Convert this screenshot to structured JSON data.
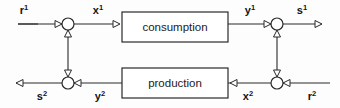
{
  "diagram": {
    "background_color": "#fdfdfd",
    "line_color": "#2a2a2a",
    "blocks": [
      {
        "id": "consumption",
        "label": "consumption",
        "x": 122,
        "y": 12,
        "w": 106,
        "h": 30
      },
      {
        "id": "production",
        "label": "production",
        "x": 122,
        "y": 68,
        "w": 106,
        "h": 30
      }
    ],
    "junctions": [
      {
        "id": "sum-top-left",
        "cx": 68,
        "cy": 24,
        "r": 6
      },
      {
        "id": "sum-top-right",
        "cx": 277,
        "cy": 24,
        "r": 6
      },
      {
        "id": "sum-bottom-left",
        "cx": 68,
        "cy": 83,
        "r": 6
      },
      {
        "id": "sum-bottom-right",
        "cx": 277,
        "cy": 83,
        "r": 6
      }
    ],
    "signals": [
      {
        "id": "r1",
        "base": "r",
        "sup": "1",
        "text": "r¹",
        "x": 24,
        "y": 14
      },
      {
        "id": "x1",
        "base": "x",
        "sup": "1",
        "text": "x¹",
        "x": 98,
        "y": 14
      },
      {
        "id": "y1",
        "base": "y",
        "sup": "1",
        "text": "y¹",
        "x": 250,
        "y": 14
      },
      {
        "id": "s1",
        "base": "s",
        "sup": "1",
        "text": "s¹",
        "x": 302,
        "y": 14
      },
      {
        "id": "s2",
        "base": "s",
        "sup": "2",
        "text": "s²",
        "x": 42,
        "y": 100
      },
      {
        "id": "y2",
        "base": "y",
        "sup": "2",
        "text": "y²",
        "x": 100,
        "y": 100
      },
      {
        "id": "x2",
        "base": "x",
        "sup": "2",
        "text": "x²",
        "x": 248,
        "y": 100
      },
      {
        "id": "r2",
        "base": "r",
        "sup": "2",
        "text": "r²",
        "x": 312,
        "y": 100
      }
    ]
  }
}
